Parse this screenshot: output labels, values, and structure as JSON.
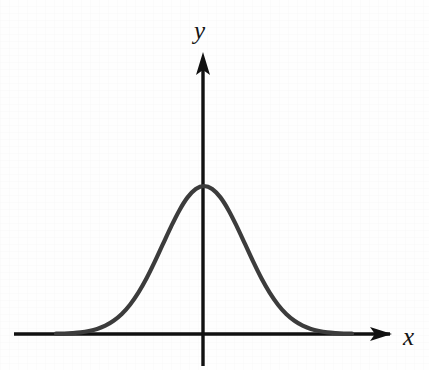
{
  "figure": {
    "kind": "cartesian-axes-with-curve",
    "background_color": "#fefefe",
    "axis_color": "#111111",
    "curve_color": "#3c3c3c",
    "axis_stroke_width": 3.4,
    "curve_stroke_width": 4.2,
    "x_axis_label": "x",
    "y_axis_label": "y"
  },
  "chart_data": {
    "type": "line",
    "title": "",
    "subtitle": "",
    "xlabel": "x",
    "ylabel": "y",
    "grid": false,
    "legend": false,
    "annotations": [],
    "tick_labels": {
      "x": [],
      "y": []
    },
    "xlim": [
      -3.6,
      3.6
    ],
    "ylim": [
      0,
      1.12
    ],
    "series": [
      {
        "name": "bell-curve",
        "function": "exp(-x^2/2)",
        "x": [
          -3.6,
          -3.4,
          -3.2,
          -3.0,
          -2.8,
          -2.6,
          -2.4,
          -2.2,
          -2.0,
          -1.8,
          -1.6,
          -1.4,
          -1.2,
          -1.0,
          -0.8,
          -0.6,
          -0.4,
          -0.2,
          0.0,
          0.2,
          0.4,
          0.6,
          0.8,
          1.0,
          1.2,
          1.4,
          1.6,
          1.8,
          2.0,
          2.2,
          2.4,
          2.6,
          2.8,
          3.0,
          3.2,
          3.4,
          3.6
        ],
        "y": [
          0.002,
          0.003,
          0.006,
          0.011,
          0.02,
          0.034,
          0.056,
          0.089,
          0.135,
          0.198,
          0.278,
          0.375,
          0.487,
          0.607,
          0.726,
          0.835,
          0.923,
          0.98,
          1.0,
          0.98,
          0.923,
          0.835,
          0.726,
          0.607,
          0.487,
          0.375,
          0.278,
          0.198,
          0.135,
          0.089,
          0.056,
          0.034,
          0.02,
          0.011,
          0.006,
          0.003,
          0.002
        ]
      }
    ]
  },
  "geometry": {
    "origin_px": {
      "x": 203,
      "y": 334
    },
    "x_axis_start_px": 14,
    "x_axis_arrow_tip_px": 392,
    "y_axis_arrow_tip_px": 52,
    "y_axis_bottom_px": 366,
    "peak_px": {
      "x": 203,
      "y": 186
    },
    "curve_left_px": 56,
    "curve_right_px": 352
  }
}
